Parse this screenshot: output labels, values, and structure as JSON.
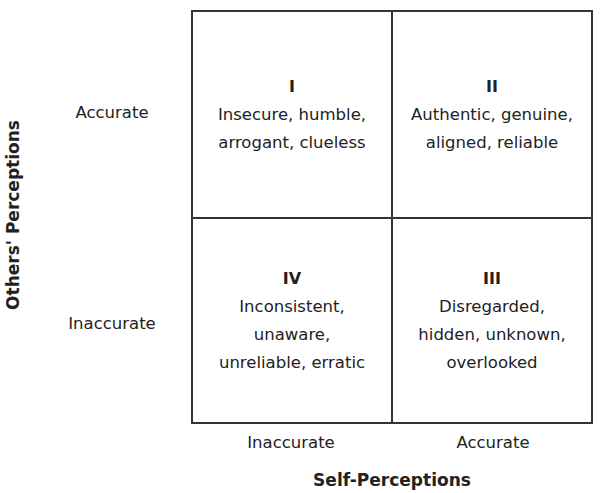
{
  "diagram": {
    "type": "2x2 matrix",
    "y_axis_label": "Others' Perceptions",
    "x_axis_label": "Self-Perceptions",
    "row_labels": [
      "Accurate",
      "Inaccurate"
    ],
    "column_labels": [
      "Inaccurate",
      "Accurate"
    ],
    "quadrants": [
      {
        "numeral": "I",
        "lines": [
          "Insecure, humble,",
          "arrogant, clueless"
        ]
      },
      {
        "numeral": "II",
        "lines": [
          "Authentic, genuine,",
          "aligned, reliable"
        ]
      },
      {
        "numeral": "IV",
        "lines": [
          "Inconsistent,",
          "unaware,",
          "unreliable, erratic"
        ]
      },
      {
        "numeral": "III",
        "lines": [
          "Disregarded,",
          "hidden, unknown,",
          "overlooked"
        ]
      }
    ],
    "colors": {
      "line": "#333333",
      "text": "#222222",
      "background": "#ffffff"
    }
  }
}
